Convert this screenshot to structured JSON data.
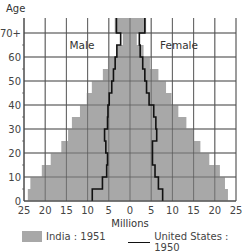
{
  "chart_data": {
    "type": "bar",
    "subtype": "population-pyramid",
    "title": "",
    "ylabel": "Age",
    "xlabel": "Millions",
    "side_labels": {
      "left": "Male",
      "right": "Female"
    },
    "age_groups": [
      "0-5",
      "5-10",
      "10-15",
      "15-20",
      "20-25",
      "25-30",
      "30-35",
      "35-40",
      "40-45",
      "45-50",
      "50-55",
      "55-60",
      "60-65",
      "65-70",
      "70+"
    ],
    "y_ticks": [
      "0",
      "10",
      "20",
      "30",
      "40",
      "50",
      "60",
      "70+"
    ],
    "x_ticks": [
      "25",
      "20",
      "15",
      "10",
      "5",
      "0",
      "5",
      "10",
      "15",
      "20",
      "25"
    ],
    "xlim": [
      -25,
      25
    ],
    "ylim": [
      0,
      75
    ],
    "grid": true,
    "series": [
      {
        "name": "India: 1951",
        "style": "bars",
        "color": "#a8a8a8",
        "male": [
          24.1,
          23.5,
          20.8,
          18.7,
          16.2,
          14.6,
          13.7,
          11.8,
          10.2,
          9.0,
          6.4,
          5.2,
          3.1,
          1.7,
          3.6
        ],
        "female": [
          23.1,
          22.4,
          21.2,
          18.7,
          16.6,
          14.9,
          13.3,
          11.4,
          9.8,
          8.5,
          6.7,
          4.7,
          3.2,
          1.6,
          3.8
        ]
      },
      {
        "name": "United States: 1950",
        "style": "step-line",
        "color": "#111111",
        "male": [
          8.9,
          6.5,
          5.5,
          5.3,
          5.7,
          6.0,
          5.3,
          5.2,
          4.9,
          4.3,
          3.9,
          3.5,
          3.1,
          2.2,
          3.2
        ],
        "female": [
          7.7,
          6.7,
          5.9,
          5.3,
          5.3,
          6.3,
          6.1,
          5.6,
          4.5,
          3.9,
          3.5,
          3.0,
          2.4,
          2.2,
          3.5
        ]
      }
    ],
    "legend": {
      "placement": "bottom",
      "items": [
        {
          "label": "India : 1951",
          "kind": "swatch"
        },
        {
          "label": "United States : 1950",
          "kind": "line"
        }
      ]
    }
  }
}
